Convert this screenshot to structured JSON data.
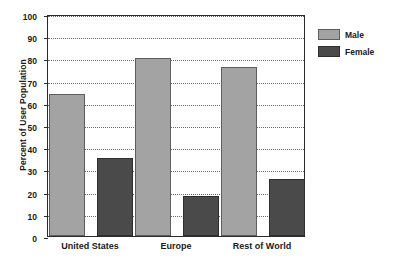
{
  "chart_data": {
    "type": "bar",
    "title": "",
    "xlabel": "",
    "ylabel": "Percent of User Population",
    "categories": [
      "United States",
      "Europe",
      "Rest of World"
    ],
    "series": [
      {
        "name": "Male",
        "color": "#a3a3a3",
        "values": [
          64,
          80,
          76
        ]
      },
      {
        "name": "Female",
        "color": "#4a4a4a",
        "values": [
          35,
          18,
          25.5
        ]
      }
    ],
    "ylim": [
      0,
      100
    ],
    "ytick_step": 10,
    "yticks": [
      0,
      10,
      20,
      30,
      40,
      50,
      60,
      70,
      80,
      90,
      100
    ],
    "ytick_labels": [
      "0",
      "10",
      "20",
      "30",
      "40",
      "50",
      "60",
      "70",
      "80",
      "90",
      "100"
    ],
    "grid": true,
    "grid_axis": "y",
    "grid_style": "dotted",
    "legend_position": "right-outside",
    "legend_entries": [
      "Male",
      "Female"
    ],
    "plot_background": "#ffffff",
    "frame_color": "#2b2b2b"
  }
}
